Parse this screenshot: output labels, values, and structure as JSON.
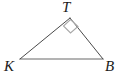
{
  "figure": {
    "type": "geometry-diagram",
    "shape": "triangle",
    "background_color": "#ffffff",
    "canvas": {
      "width": 121,
      "height": 78
    },
    "vertices": [
      {
        "id": "T",
        "label": "T",
        "x": 70,
        "y": 18,
        "label_x": 62,
        "label_y": 0
      },
      {
        "id": "K",
        "label": "K",
        "x": 20,
        "y": 59,
        "label_x": 4,
        "label_y": 59
      },
      {
        "id": "B",
        "label": "B",
        "x": 103,
        "y": 59,
        "label_x": 105,
        "label_y": 59
      }
    ],
    "edges": [
      {
        "id": "KT",
        "from": "K",
        "to": "T",
        "color": "#4a4a4a",
        "width": 1
      },
      {
        "id": "TB",
        "from": "T",
        "to": "B",
        "color": "#4a4a4a",
        "width": 1
      },
      {
        "id": "KB",
        "from": "K",
        "to": "B",
        "color": "#9a9a9a",
        "width": 1.4
      }
    ],
    "angle_marks": [
      {
        "id": "right-angle-T",
        "at_vertex": "T",
        "kind": "right-angle-square",
        "degrees": 90,
        "color": "#a8a8a8",
        "points": "70.5,19.5 78,26.5 70.5,33 63.5,26"
      }
    ],
    "label_color": "#1a1a1a",
    "label_style": "italic-serif"
  }
}
